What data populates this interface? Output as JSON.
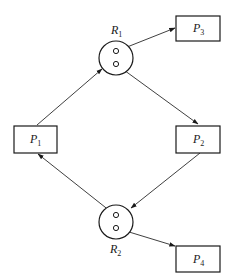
{
  "diagram": {
    "processes": [
      {
        "id": "P1",
        "letter": "P",
        "sub": "1"
      },
      {
        "id": "P2",
        "letter": "P",
        "sub": "2"
      },
      {
        "id": "P3",
        "letter": "P",
        "sub": "3"
      },
      {
        "id": "P4",
        "letter": "P",
        "sub": "4"
      }
    ],
    "resources": [
      {
        "id": "R1",
        "letter": "R",
        "sub": "1",
        "instances": 2
      },
      {
        "id": "R2",
        "letter": "R",
        "sub": "2",
        "instances": 2
      }
    ],
    "edges": [
      {
        "from": "P1",
        "to": "R1",
        "type": "request"
      },
      {
        "from": "R1",
        "to": "P3",
        "type": "assignment"
      },
      {
        "from": "R1",
        "to": "P2",
        "type": "assignment"
      },
      {
        "from": "P2",
        "to": "R2",
        "type": "request"
      },
      {
        "from": "R2",
        "to": "P1",
        "type": "assignment"
      },
      {
        "from": "R2",
        "to": "P4",
        "type": "assignment"
      }
    ]
  }
}
